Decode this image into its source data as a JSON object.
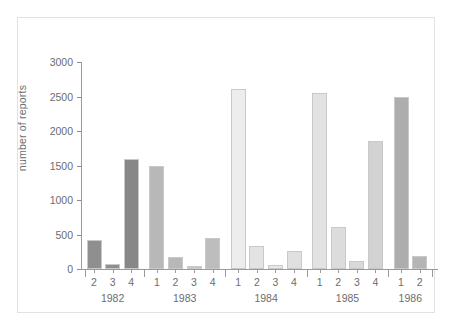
{
  "chart_data": {
    "type": "bar",
    "title": "",
    "subtitle": "",
    "xlabel": "",
    "ylabel": "number of reports",
    "ylim": [
      0,
      3000
    ],
    "ytick_values": [
      0,
      500,
      1000,
      1500,
      2000,
      2500,
      3000
    ],
    "ytick_labels": [
      "0",
      "500",
      "1000",
      "1500",
      "2000",
      "2500",
      "3000"
    ],
    "grid": false,
    "legend": "none",
    "x_group_label_key": "year",
    "x_item_label_key": "quarter",
    "categories": [
      "1982 Q2",
      "1982 Q3",
      "1982 Q4",
      "1983 Q1",
      "1983 Q2",
      "1983 Q3",
      "1983 Q4",
      "1984 Q1",
      "1984 Q2",
      "1984 Q3",
      "1984 Q4",
      "1985 Q1",
      "1985 Q2",
      "1985 Q3",
      "1985 Q4",
      "1986 Q1",
      "1986 Q2"
    ],
    "values": [
      420,
      70,
      1590,
      1500,
      170,
      45,
      455,
      2610,
      340,
      55,
      260,
      2555,
      610,
      110,
      1855,
      2490,
      195
    ],
    "bars": [
      {
        "year": "1982",
        "quarter": "2",
        "value": 420,
        "color": "#8f8f8f"
      },
      {
        "year": "1982",
        "quarter": "3",
        "value": 70,
        "color": "#8f8f8f"
      },
      {
        "year": "1982",
        "quarter": "4",
        "value": 1590,
        "color": "#878787"
      },
      {
        "year": "1983",
        "quarter": "1",
        "value": 1500,
        "color": "#b8b8b8"
      },
      {
        "year": "1983",
        "quarter": "2",
        "value": 170,
        "color": "#b8b8b8"
      },
      {
        "year": "1983",
        "quarter": "3",
        "value": 45,
        "color": "#c6c6c6"
      },
      {
        "year": "1983",
        "quarter": "4",
        "value": 455,
        "color": "#bdbdbd"
      },
      {
        "year": "1984",
        "quarter": "1",
        "value": 2610,
        "color": "#ededed"
      },
      {
        "year": "1984",
        "quarter": "2",
        "value": 340,
        "color": "#e3e3e3"
      },
      {
        "year": "1984",
        "quarter": "3",
        "value": 55,
        "color": "#e8e8e8"
      },
      {
        "year": "1984",
        "quarter": "4",
        "value": 260,
        "color": "#e0e0e0"
      },
      {
        "year": "1985",
        "quarter": "1",
        "value": 2555,
        "color": "#e2e2e2"
      },
      {
        "year": "1985",
        "quarter": "2",
        "value": 610,
        "color": "#dcdcdc"
      },
      {
        "year": "1985",
        "quarter": "3",
        "value": 110,
        "color": "#d9d9d9"
      },
      {
        "year": "1985",
        "quarter": "4",
        "value": 1855,
        "color": "#d2d2d2"
      },
      {
        "year": "1986",
        "quarter": "1",
        "value": 2490,
        "color": "#adadad"
      },
      {
        "year": "1986",
        "quarter": "2",
        "value": 195,
        "color": "#b5b5b5"
      }
    ],
    "year_groups": [
      {
        "label": "1982",
        "quarters": [
          "2",
          "3",
          "4"
        ]
      },
      {
        "label": "1983",
        "quarters": [
          "1",
          "2",
          "3",
          "4"
        ]
      },
      {
        "label": "1984",
        "quarters": [
          "1",
          "2",
          "3",
          "4"
        ]
      },
      {
        "label": "1985",
        "quarters": [
          "1",
          "2",
          "3",
          "4"
        ]
      },
      {
        "label": "1986",
        "quarters": [
          "1",
          "2"
        ]
      }
    ]
  },
  "colors": {
    "axis": "#9a9a9a",
    "text": "#6d6d6d",
    "frame": "#e2e2e2",
    "background": "#ffffff",
    "bar_outline": "#c9c9c9"
  }
}
